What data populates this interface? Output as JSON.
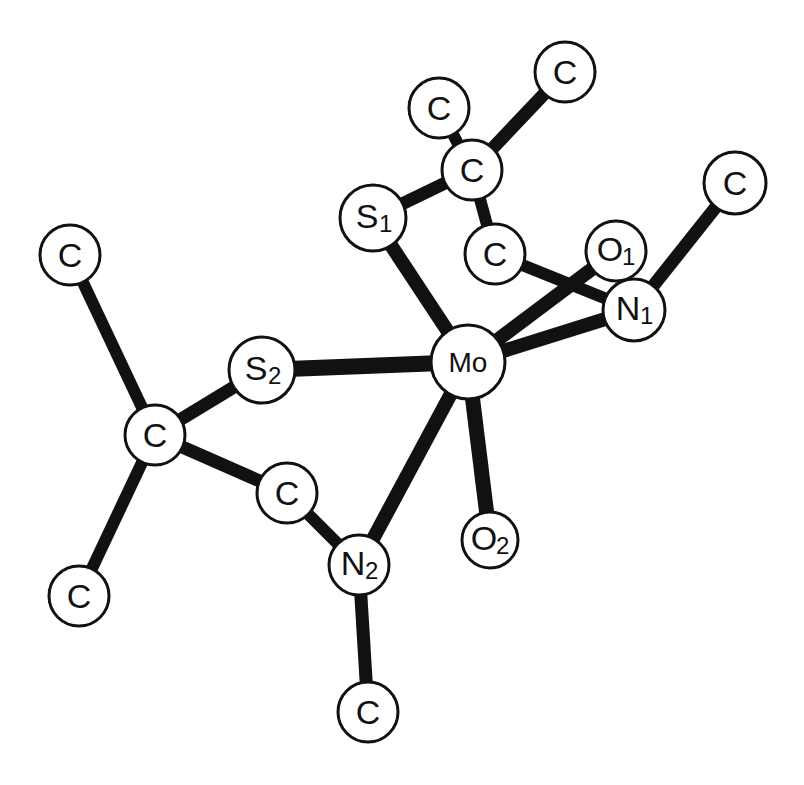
{
  "diagram": {
    "colors": {
      "ink": "#111111",
      "fill": "#ffffff",
      "background": "#ffffff"
    },
    "atoms": [
      {
        "id": "c_top",
        "element": "C",
        "sub": "",
        "x": 565,
        "y": 72,
        "r": 30
      },
      {
        "id": "c_topleft",
        "element": "C",
        "sub": "",
        "x": 439,
        "y": 108,
        "r": 30
      },
      {
        "id": "c_quat1",
        "element": "C",
        "sub": "",
        "x": 472,
        "y": 170,
        "r": 30
      },
      {
        "id": "c_right",
        "element": "C",
        "sub": "",
        "x": 735,
        "y": 183,
        "r": 31
      },
      {
        "id": "s1",
        "element": "S",
        "sub": "1",
        "x": 373,
        "y": 218,
        "r": 33
      },
      {
        "id": "c_ch2_1",
        "element": "C",
        "sub": "",
        "x": 495,
        "y": 254,
        "r": 30
      },
      {
        "id": "o1",
        "element": "O",
        "sub": "1",
        "x": 616,
        "y": 251,
        "r": 30
      },
      {
        "id": "n1",
        "element": "N",
        "sub": "1",
        "x": 634,
        "y": 310,
        "r": 31
      },
      {
        "id": "c_left",
        "element": "C",
        "sub": "",
        "x": 70,
        "y": 255,
        "r": 30
      },
      {
        "id": "s2",
        "element": "S",
        "sub": "2",
        "x": 262,
        "y": 370,
        "r": 33
      },
      {
        "id": "mo",
        "element": "Mo",
        "sub": "",
        "x": 468,
        "y": 362,
        "r": 37
      },
      {
        "id": "c_quat2",
        "element": "C",
        "sub": "",
        "x": 155,
        "y": 435,
        "r": 30
      },
      {
        "id": "c_ch2_2",
        "element": "C",
        "sub": "",
        "x": 287,
        "y": 493,
        "r": 30
      },
      {
        "id": "o2",
        "element": "O",
        "sub": "2",
        "x": 490,
        "y": 540,
        "r": 28
      },
      {
        "id": "n2",
        "element": "N",
        "sub": "2",
        "x": 359,
        "y": 565,
        "r": 30
      },
      {
        "id": "c_botleft",
        "element": "C",
        "sub": "",
        "x": 79,
        "y": 596,
        "r": 30
      },
      {
        "id": "c_bottom",
        "element": "C",
        "sub": "",
        "x": 368,
        "y": 712,
        "r": 30
      }
    ],
    "bonds": [
      {
        "from": "c_ch2_1",
        "to": "n1",
        "width": 12
      },
      {
        "from": "c_quat1",
        "to": "c_ch2_1",
        "width": 12
      },
      {
        "from": "c_topleft",
        "to": "c_quat1",
        "width": 12
      },
      {
        "from": "c_quat1",
        "to": "c_top",
        "width": 13
      },
      {
        "from": "s1",
        "to": "c_quat1",
        "width": 13
      },
      {
        "from": "s1",
        "to": "mo",
        "width": 14
      },
      {
        "from": "mo",
        "to": "o1",
        "width": 14
      },
      {
        "from": "mo",
        "to": "n1",
        "width": 14
      },
      {
        "from": "n1",
        "to": "c_right",
        "width": 13
      },
      {
        "from": "s2",
        "to": "mo",
        "width": 16
      },
      {
        "from": "c_left",
        "to": "c_quat2",
        "width": 12
      },
      {
        "from": "c_quat2",
        "to": "s2",
        "width": 13
      },
      {
        "from": "c_quat2",
        "to": "c_ch2_2",
        "width": 13
      },
      {
        "from": "c_quat2",
        "to": "c_botleft",
        "width": 12
      },
      {
        "from": "c_ch2_2",
        "to": "n2",
        "width": 12
      },
      {
        "from": "mo",
        "to": "n2",
        "width": 14
      },
      {
        "from": "mo",
        "to": "o2",
        "width": 15
      },
      {
        "from": "n2",
        "to": "c_bottom",
        "width": 13
      }
    ]
  }
}
